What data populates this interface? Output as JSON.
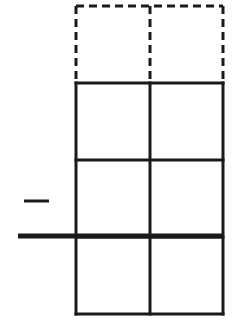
{
  "diagram": {
    "colors": {
      "stroke": "#1a1a1a",
      "background": "#ffffff"
    },
    "grid": {
      "columns_x": [
        76,
        150,
        223
      ],
      "dashed_rows_y": [
        6,
        83
      ],
      "solid_rows_y": [
        83,
        160,
        237,
        314
      ],
      "stroke_width": 3,
      "dash_pattern": "8 5"
    },
    "thick_line": {
      "x1": 18,
      "x2": 223,
      "y": 236,
      "stroke_width": 5
    },
    "short_dash": {
      "x1": 24,
      "x2": 49,
      "y": 201,
      "stroke_width": 3
    }
  }
}
